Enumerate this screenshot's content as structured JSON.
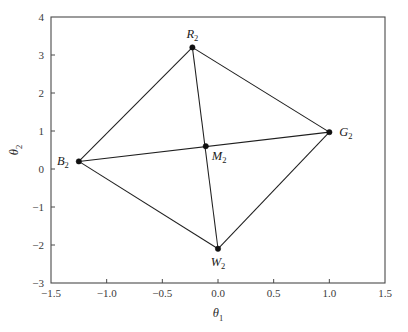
{
  "chart_data": {
    "type": "scatter",
    "title": "",
    "subtitle": "",
    "xlabel": "θ₁",
    "ylabel": "θ₂",
    "xlabel_base": "θ",
    "xlabel_sub": "1",
    "ylabel_base": "θ",
    "ylabel_sub": "2",
    "xlim": [
      -1.5,
      1.5
    ],
    "ylim": [
      -3,
      4
    ],
    "xticks": [
      -1.5,
      -1.0,
      -0.5,
      0.0,
      0.5,
      1.0,
      1.5
    ],
    "xtick_labels": [
      "−1.5",
      "−1.0",
      "−0.5",
      "0.0",
      "0.5",
      "1.0",
      "1.5"
    ],
    "yticks": [
      -3,
      -2,
      -1,
      0,
      1,
      2,
      3,
      4
    ],
    "ytick_labels": [
      "−3",
      "−2",
      "−1",
      "0",
      "1",
      "2",
      "3",
      "4"
    ],
    "grid": false,
    "legend": "none",
    "frame": true,
    "points": [
      {
        "id": "B2",
        "label_base": "B",
        "label_sub": "2",
        "x": -1.25,
        "y": 0.2,
        "label_pos": "left"
      },
      {
        "id": "R2",
        "label_base": "R",
        "label_sub": "2",
        "x": -0.23,
        "y": 3.2,
        "label_pos": "above"
      },
      {
        "id": "G2",
        "label_base": "G",
        "label_sub": "2",
        "x": 1.0,
        "y": 0.97,
        "label_pos": "right"
      },
      {
        "id": "W2",
        "label_base": "W",
        "label_sub": "2",
        "x": 0.0,
        "y": -2.1,
        "label_pos": "below"
      },
      {
        "id": "M2",
        "label_base": "M",
        "label_sub": "2",
        "x": -0.11,
        "y": 0.6,
        "label_pos": "below-right"
      }
    ],
    "edges": [
      {
        "from": "B2",
        "to": "R2",
        "kind": "edge"
      },
      {
        "from": "R2",
        "to": "G2",
        "kind": "edge"
      },
      {
        "from": "G2",
        "to": "W2",
        "kind": "edge"
      },
      {
        "from": "W2",
        "to": "B2",
        "kind": "edge"
      },
      {
        "from": "B2",
        "to": "G2",
        "kind": "diagonal"
      },
      {
        "from": "R2",
        "to": "W2",
        "kind": "diagonal"
      }
    ]
  },
  "figure": {
    "background_color": "#ffffff",
    "line_color": "#1f1f1f",
    "axis_color": "#4a4a4a",
    "marker_color": "#111111",
    "text_color": "#1a1a1a"
  }
}
